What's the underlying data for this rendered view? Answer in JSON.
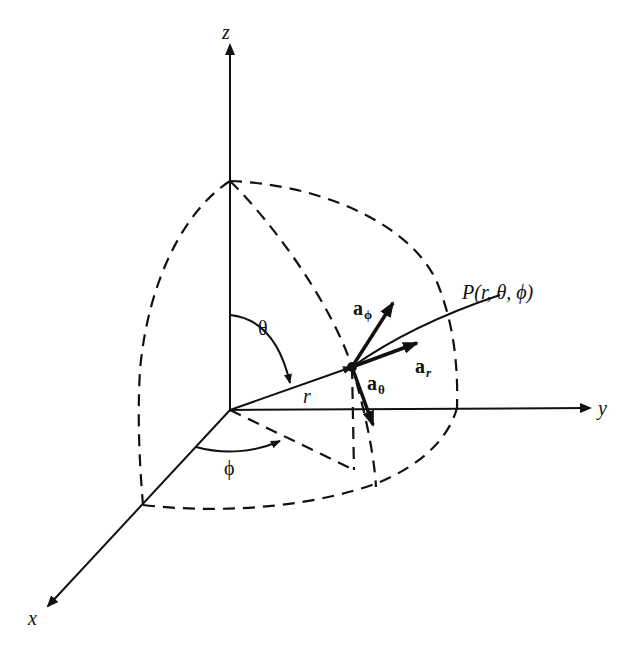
{
  "diagram": {
    "axes": {
      "x": "x",
      "y": "y",
      "z": "z"
    },
    "labels": {
      "theta": "θ",
      "phi": "ϕ",
      "r": "r",
      "point": "P(r, θ, ϕ)"
    },
    "unit_vectors": {
      "a_r": {
        "base": "a",
        "sub": "r"
      },
      "a_theta": {
        "base": "a",
        "sub": "θ"
      },
      "a_phi": {
        "base": "a",
        "sub": "ϕ"
      }
    },
    "colors": {
      "ink": "#111111",
      "background": "#ffffff"
    }
  }
}
